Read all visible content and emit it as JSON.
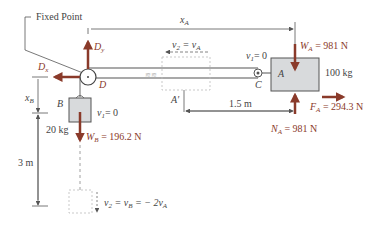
{
  "diagram": {
    "labels": {
      "fixed_point": "Fixed Point",
      "xA": "x",
      "xA_sub": "A",
      "Dy": "D",
      "Dy_sub": "y",
      "Dx": "D",
      "Dx_sub": "x",
      "D": "D",
      "v2_top": "v",
      "v2_top_sub": "2",
      "v2_top_eq": " = v",
      "v2_top_eq_sub": "A",
      "v1_A": "v",
      "v1_A_sub": "1",
      "v1_A_eq": "= 0",
      "C": "C",
      "A": "A",
      "A_prime": "A′",
      "WA": "W",
      "WA_sub": "A",
      "WA_eq": " = 981 N",
      "mass_A": "100 kg",
      "FA": "F",
      "FA_sub": "A",
      "FA_eq": " = 294.3 N",
      "NA": "N",
      "NA_sub": "A",
      "NA_eq": " = 981 N",
      "dist_1_5": "1.5 m",
      "xB": "x",
      "xB_sub": "B",
      "B": "B",
      "v1_B": "v",
      "v1_B_sub": "1",
      "v1_B_eq": "= 0",
      "mass_B": "20 kg",
      "WB": "W",
      "WB_sub": "B",
      "WB_eq": " = 196.2 N",
      "dist_3": "3 m",
      "v2_bottom": "v",
      "v2_bottom_sub": "2",
      "v2_bottom_eq": " = v",
      "v2_bottom_eq_sub": "B",
      "v2_bottom_eq2": " = − 2v",
      "v2_bottom_eq2_sub": "A"
    },
    "colors": {
      "force_arrow": "#8a3a2a",
      "line": "#555555",
      "block_fill": "#d8dadc",
      "dashed": "#bbbbbb"
    }
  }
}
